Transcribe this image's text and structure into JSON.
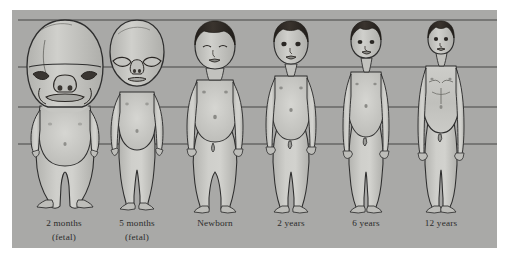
{
  "plate": {
    "title": "Changes in body proportions during growth",
    "panel_background_color": "#a9a9a7",
    "body_fill_color": "#c9c9c6",
    "body_shade_color": "#b0b0ad",
    "outline_color": "#2e2e2e",
    "hair_color": "#2a2723",
    "gridline_color": "#3a3a3a",
    "caption_color": "#2b2b2b",
    "page_background_color": "#ffffff"
  },
  "gridlines": {
    "count": 4,
    "label": "horizontal proportion reference lines",
    "y_values": [
      20,
      67,
      107,
      144
    ],
    "x_start": 18,
    "x_end": 497
  },
  "panel": {
    "x": 12,
    "y": 10,
    "width": 485,
    "height": 238
  },
  "figures": [
    {
      "id": "fetal-2-months",
      "caption_line1": "2 months",
      "caption_line2": "(fetal)",
      "center_x": 64,
      "baseline_y": 209,
      "head_top_y": 20,
      "chin_y": 107,
      "head_fraction_of_body": 0.46,
      "stage": "fetal",
      "heads_tall": 2.2
    },
    {
      "id": "fetal-5-months",
      "caption_line1": "5 months",
      "caption_line2": "(fetal)",
      "center_x": 137,
      "baseline_y": 209,
      "head_top_y": 20,
      "chin_y": 82,
      "head_fraction_of_body": 0.33,
      "stage": "fetal",
      "heads_tall": 3.0
    },
    {
      "id": "newborn",
      "caption_line1": "Newborn",
      "caption_line2": "",
      "center_x": 215,
      "baseline_y": 209,
      "head_top_y": 20,
      "chin_y": 70,
      "head_fraction_of_body": 0.265,
      "stage": "postnatal",
      "heads_tall": 3.8
    },
    {
      "id": "age-2-years",
      "caption_line1": "2 years",
      "caption_line2": "",
      "center_x": 291,
      "baseline_y": 209,
      "head_top_y": 20,
      "chin_y": 64,
      "head_fraction_of_body": 0.233,
      "stage": "postnatal",
      "heads_tall": 4.3
    },
    {
      "id": "age-6-years",
      "caption_line1": "6 years",
      "caption_line2": "",
      "center_x": 366,
      "baseline_y": 209,
      "head_top_y": 20,
      "chin_y": 58,
      "head_fraction_of_body": 0.201,
      "stage": "postnatal",
      "heads_tall": 5.0
    },
    {
      "id": "age-12-years",
      "caption_line1": "12  years",
      "caption_line2": "",
      "center_x": 441,
      "baseline_y": 209,
      "head_top_y": 20,
      "chin_y": 53,
      "head_fraction_of_body": 0.175,
      "stage": "postnatal",
      "heads_tall": 5.7
    }
  ],
  "captions": {
    "line1_y": 226,
    "line2_y": 240
  }
}
